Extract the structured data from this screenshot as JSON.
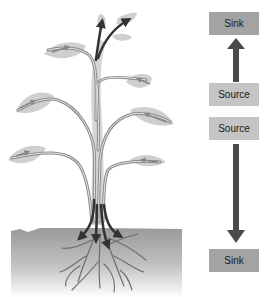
{
  "diagram": {
    "boxes": {
      "sink_top": "Sink",
      "source_upper": "Source",
      "source_lower": "Source",
      "sink_bottom": "Sink"
    },
    "arrows": {
      "upper": "up",
      "lower": "down"
    },
    "colors": {
      "sink_box": "#a3a3a3",
      "source_box": "#c4c4c4",
      "arrow": "#4a4a4a",
      "leaf": "#cfcfcf",
      "soil_top": "#9a9a9a",
      "soil_bottom": "#ffffff",
      "phloem_dark": "#3a3a3a"
    }
  }
}
